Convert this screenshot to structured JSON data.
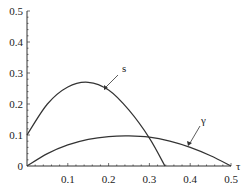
{
  "chart_data": {
    "type": "line",
    "title": "",
    "xlabel": "τ",
    "ylabel": "",
    "xlim": [
      0,
      0.5
    ],
    "ylim": [
      0,
      0.5
    ],
    "x_ticks": [
      "0.1",
      "0.2",
      "0.3",
      "0.4",
      "0.5"
    ],
    "y_ticks": [
      "0",
      "0.1",
      "0.2",
      "0.3",
      "0.4",
      "0.5"
    ],
    "grid": false,
    "series": [
      {
        "name": "s",
        "x": [
          0,
          0.05,
          0.1,
          0.15,
          0.2,
          0.25,
          0.3,
          0.338
        ],
        "values": [
          0.1,
          0.2,
          0.255,
          0.27,
          0.245,
          0.18,
          0.09,
          0
        ]
      },
      {
        "name": "γ",
        "x": [
          0,
          0.05,
          0.1,
          0.15,
          0.2,
          0.25,
          0.3,
          0.35,
          0.4,
          0.45,
          0.5
        ],
        "values": [
          0,
          0.04,
          0.068,
          0.086,
          0.095,
          0.097,
          0.093,
          0.08,
          0.06,
          0.033,
          0
        ]
      }
    ],
    "annotations": [
      {
        "label": "s",
        "points_to": "s curve near τ≈0.19"
      },
      {
        "label": "γ",
        "points_to": "γ curve near τ≈0.38"
      }
    ]
  },
  "axis_labels": {
    "x": "τ",
    "zero": "0"
  },
  "labels": {
    "s": "s",
    "gamma": "γ"
  }
}
